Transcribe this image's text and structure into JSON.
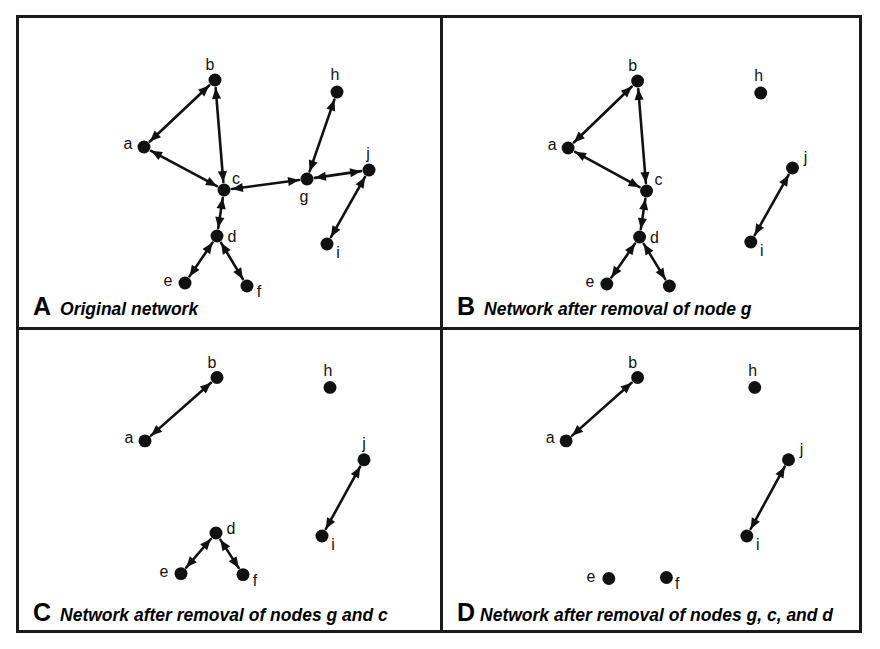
{
  "figure": {
    "width": 880,
    "height": 649,
    "background": "#ffffff",
    "ink_color": "#111111",
    "node_radius": 6.5,
    "node_color": "#111111",
    "edge_color": "#111111",
    "edge_width": 2.6,
    "arrow_style": "double-headed",
    "border_color": "#1a1a1a"
  },
  "panels": [
    {
      "id": "A",
      "letter": "A",
      "caption": "Original network",
      "tight": false,
      "removed_nodes": [],
      "nodes": [
        {
          "id": "a",
          "label": "a",
          "x": 125,
          "y": 129,
          "lx": -16,
          "ly": -2,
          "isolated": false
        },
        {
          "id": "b",
          "label": "b",
          "x": 196,
          "y": 62,
          "lx": -5,
          "ly": -14,
          "isolated": false
        },
        {
          "id": "c",
          "label": "c",
          "x": 205,
          "y": 172,
          "lx": 12,
          "ly": -10,
          "isolated": false
        },
        {
          "id": "d",
          "label": "d",
          "x": 198,
          "y": 218,
          "lx": 15,
          "ly": 2,
          "isolated": false
        },
        {
          "id": "e",
          "label": "e",
          "x": 166,
          "y": 265,
          "lx": -17,
          "ly": -1,
          "isolated": false
        },
        {
          "id": "f",
          "label": "f",
          "x": 228,
          "y": 268,
          "lx": 12,
          "ly": 7,
          "isolated": false
        },
        {
          "id": "g",
          "label": "g",
          "x": 288,
          "y": 161,
          "lx": -3,
          "ly": 19,
          "isolated": false
        },
        {
          "id": "h",
          "label": "h",
          "x": 318,
          "y": 74,
          "lx": -2,
          "ly": -16,
          "isolated": false
        },
        {
          "id": "i",
          "label": "i",
          "x": 308,
          "y": 226,
          "lx": 11,
          "ly": 10,
          "isolated": false
        },
        {
          "id": "j",
          "label": "j",
          "x": 350,
          "y": 152,
          "lx": -1,
          "ly": -15,
          "isolated": false
        }
      ],
      "edges": [
        {
          "from": "a",
          "to": "b"
        },
        {
          "from": "b",
          "to": "c"
        },
        {
          "from": "c",
          "to": "a"
        },
        {
          "from": "c",
          "to": "d"
        },
        {
          "from": "d",
          "to": "e"
        },
        {
          "from": "d",
          "to": "f"
        },
        {
          "from": "c",
          "to": "g"
        },
        {
          "from": "g",
          "to": "h"
        },
        {
          "from": "g",
          "to": "j"
        },
        {
          "from": "j",
          "to": "i"
        }
      ]
    },
    {
      "id": "B",
      "letter": "B",
      "caption": "Network after removal of node g",
      "tight": false,
      "removed_nodes": [
        "g"
      ],
      "nodes": [
        {
          "id": "a",
          "label": "a",
          "x": 126,
          "y": 130,
          "lx": -16,
          "ly": -2,
          "isolated": false
        },
        {
          "id": "b",
          "label": "b",
          "x": 196,
          "y": 63,
          "lx": -5,
          "ly": -14,
          "isolated": false
        },
        {
          "id": "c",
          "label": "c",
          "x": 205,
          "y": 173,
          "lx": 12,
          "ly": -10,
          "isolated": false
        },
        {
          "id": "d",
          "label": "d",
          "x": 198,
          "y": 219,
          "lx": 15,
          "ly": 2,
          "isolated": false
        },
        {
          "id": "e",
          "label": "e",
          "x": 165,
          "y": 266,
          "lx": -17,
          "ly": -1,
          "isolated": false
        },
        {
          "id": "f",
          "label": "",
          "x": 228,
          "y": 268,
          "lx": 12,
          "ly": 7,
          "isolated": false
        },
        {
          "id": "h",
          "label": "h",
          "x": 320,
          "y": 75,
          "lx": -2,
          "ly": -16,
          "isolated": true
        },
        {
          "id": "i",
          "label": "i",
          "x": 310,
          "y": 224,
          "lx": 11,
          "ly": 10,
          "isolated": false
        },
        {
          "id": "j",
          "label": "j",
          "x": 352,
          "y": 150,
          "lx": 13,
          "ly": -9,
          "isolated": false
        }
      ],
      "edges": [
        {
          "from": "a",
          "to": "b"
        },
        {
          "from": "b",
          "to": "c"
        },
        {
          "from": "c",
          "to": "a"
        },
        {
          "from": "c",
          "to": "d"
        },
        {
          "from": "d",
          "to": "e"
        },
        {
          "from": "d",
          "to": "f"
        },
        {
          "from": "j",
          "to": "i"
        }
      ]
    },
    {
      "id": "C",
      "letter": "C",
      "caption": "Network after removal of nodes g and c",
      "tight": false,
      "removed_nodes": [
        "g",
        "c"
      ],
      "nodes": [
        {
          "id": "a",
          "label": "a",
          "x": 126,
          "y": 112,
          "lx": -16,
          "ly": -2,
          "isolated": false
        },
        {
          "id": "b",
          "label": "b",
          "x": 198,
          "y": 48,
          "lx": -5,
          "ly": -14,
          "isolated": false
        },
        {
          "id": "d",
          "label": "d",
          "x": 197,
          "y": 205,
          "lx": 15,
          "ly": -3,
          "isolated": false
        },
        {
          "id": "e",
          "label": "e",
          "x": 162,
          "y": 246,
          "lx": -17,
          "ly": -1,
          "isolated": false
        },
        {
          "id": "f",
          "label": "f",
          "x": 224,
          "y": 247,
          "lx": 12,
          "ly": 7,
          "isolated": false
        },
        {
          "id": "h",
          "label": "h",
          "x": 311,
          "y": 58,
          "lx": -2,
          "ly": -16,
          "isolated": true
        },
        {
          "id": "i",
          "label": "i",
          "x": 303,
          "y": 208,
          "lx": 11,
          "ly": 10,
          "isolated": false
        },
        {
          "id": "j",
          "label": "j",
          "x": 345,
          "y": 131,
          "lx": 0,
          "ly": -15,
          "isolated": false
        }
      ],
      "edges": [
        {
          "from": "a",
          "to": "b"
        },
        {
          "from": "d",
          "to": "e"
        },
        {
          "from": "d",
          "to": "f"
        },
        {
          "from": "j",
          "to": "i"
        }
      ]
    },
    {
      "id": "D",
      "letter": "D",
      "caption": "Network after removal of nodes g, c, and d",
      "tight": true,
      "removed_nodes": [
        "g",
        "c",
        "d"
      ],
      "nodes": [
        {
          "id": "a",
          "label": "a",
          "x": 124,
          "y": 112,
          "lx": -16,
          "ly": -2,
          "isolated": false
        },
        {
          "id": "b",
          "label": "b",
          "x": 196,
          "y": 48,
          "lx": -5,
          "ly": -14,
          "isolated": false
        },
        {
          "id": "e",
          "label": "e",
          "x": 167,
          "y": 251,
          "lx": -18,
          "ly": -1,
          "isolated": true
        },
        {
          "id": "f",
          "label": "f",
          "x": 225,
          "y": 250,
          "lx": 11,
          "ly": 7,
          "isolated": true
        },
        {
          "id": "h",
          "label": "h",
          "x": 314,
          "y": 58,
          "lx": -2,
          "ly": -16,
          "isolated": true
        },
        {
          "id": "i",
          "label": "i",
          "x": 306,
          "y": 208,
          "lx": 11,
          "ly": 10,
          "isolated": false
        },
        {
          "id": "j",
          "label": "j",
          "x": 348,
          "y": 131,
          "lx": 13,
          "ly": -9,
          "isolated": false
        }
      ],
      "edges": [
        {
          "from": "a",
          "to": "b"
        },
        {
          "from": "j",
          "to": "i"
        }
      ]
    }
  ]
}
